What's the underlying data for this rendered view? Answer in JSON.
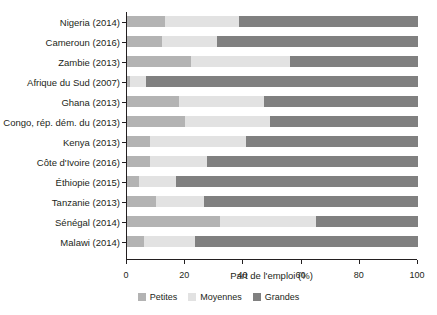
{
  "chart_data": {
    "type": "bar",
    "orientation": "horizontal",
    "stacked": true,
    "stacked_percent": true,
    "title": "",
    "subtitle": "",
    "xlabel": "Part de l'emploi (%)",
    "ylabel": "",
    "xlim": [
      0,
      100
    ],
    "xticks": [
      0,
      20,
      40,
      60,
      80,
      100
    ],
    "xticklabels": [
      "0",
      "20",
      "40",
      "60",
      "80",
      "100"
    ],
    "grid": false,
    "legend_position": "bottom-center",
    "categories": [
      "Nigeria (2014)",
      "Cameroun (2016)",
      "Zambie (2013)",
      "Afrique du Sud (2007)",
      "Ghana (2013)",
      "Congo, rép. dém. du (2013)",
      "Kenya (2013)",
      "Côte d'Ivoire (2016)",
      "Éthiopie (2015)",
      "Tanzanie (2013)",
      "Sénégal (2014)",
      "Malawi (2014)"
    ],
    "series": [
      {
        "name": "Petites",
        "color": "#b3b3b3",
        "values": [
          13,
          12,
          22,
          1,
          18,
          20,
          8,
          8,
          4,
          10,
          32,
          6
        ]
      },
      {
        "name": "Moyennes",
        "color": "#e2e2e2",
        "values": [
          25.5,
          19,
          34,
          5.5,
          29,
          29,
          33,
          19.5,
          13,
          16.5,
          33,
          17.5
        ]
      },
      {
        "name": "Grandes",
        "color": "#808080",
        "values": [
          61.5,
          69,
          44,
          93.5,
          53,
          51,
          59,
          72.5,
          83,
          73.5,
          35,
          76.5
        ]
      }
    ],
    "cumulative_boundaries": [
      {
        "category": "Nigeria (2014)",
        "small_end": 13,
        "medium_end": 38.5
      },
      {
        "category": "Cameroun (2016)",
        "small_end": 12,
        "medium_end": 31
      },
      {
        "category": "Zambie (2013)",
        "small_end": 22,
        "medium_end": 56
      },
      {
        "category": "Afrique du Sud (2007)",
        "small_end": 1,
        "medium_end": 6.5
      },
      {
        "category": "Ghana (2013)",
        "small_end": 18,
        "medium_end": 47
      },
      {
        "category": "Congo, rép. dém. du (2013)",
        "small_end": 20,
        "medium_end": 49
      },
      {
        "category": "Kenya (2013)",
        "small_end": 8,
        "medium_end": 41
      },
      {
        "category": "Côte d'Ivoire (2016)",
        "small_end": 8,
        "medium_end": 27.5
      },
      {
        "category": "Éthiopie (2015)",
        "small_end": 4,
        "medium_end": 17
      },
      {
        "category": "Tanzanie (2013)",
        "small_end": 10,
        "medium_end": 26.5
      },
      {
        "category": "Sénégal (2014)",
        "small_end": 32,
        "medium_end": 65
      },
      {
        "category": "Malawi (2014)",
        "small_end": 6,
        "medium_end": 23.5
      }
    ]
  },
  "legend": {
    "items": [
      {
        "label": "Petites",
        "color": "#b3b3b3"
      },
      {
        "label": "Moyennes",
        "color": "#e2e2e2"
      },
      {
        "label": "Grandes",
        "color": "#808080"
      }
    ]
  }
}
